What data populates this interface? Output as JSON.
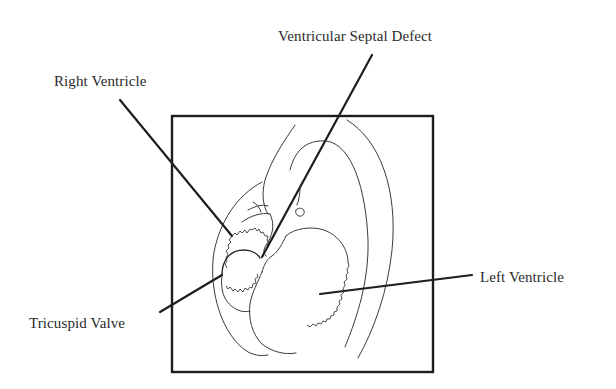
{
  "diagram": {
    "frame_color": "#1e1e1e",
    "line_color": "#1e1e1e",
    "text_color": "#2a2a2a",
    "background": "#ffffff"
  },
  "labels": {
    "right_ventricle": "Right Ventricle",
    "ventricular_septal_defect": "Ventricular Septal Defect",
    "tricuspid_valve": "Tricuspid Valve",
    "left_ventricle": "Left Ventricle"
  },
  "leaders": [
    {
      "label": "Right Ventricle",
      "from": [
        120,
        100
      ],
      "to": [
        232,
        236
      ]
    },
    {
      "label": "Ventricular Septal Defect",
      "from": [
        372,
        55
      ],
      "to": [
        262,
        257
      ]
    },
    {
      "label": "Tricuspid Valve",
      "from": [
        160,
        312
      ],
      "to": [
        222,
        275
      ]
    },
    {
      "label": "Left Ventricle",
      "from": [
        472,
        275
      ],
      "to": [
        320,
        294
      ]
    }
  ],
  "frame": {
    "x": 172,
    "y": 116,
    "width": 261,
    "height": 256
  }
}
